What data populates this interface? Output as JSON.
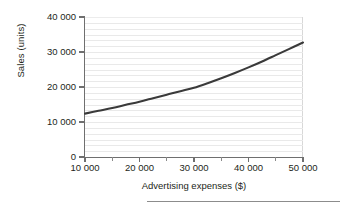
{
  "chart_data": {
    "type": "line",
    "title": "",
    "subtitle": "",
    "xlabel": "Advertising expenses ($)",
    "ylabel": "Sales (units)",
    "xlim": [
      10000,
      50000
    ],
    "ylim": [
      0,
      40000
    ],
    "grid": "horizontal-minor",
    "legend": "none",
    "line_color": "#3a3a3a",
    "grid_color": "#e9e9e9",
    "axis_color": "#6f6f6f",
    "x_ticks": [
      {
        "value": 10000,
        "label": "10 000"
      },
      {
        "value": 20000,
        "label": "20 000"
      },
      {
        "value": 30000,
        "label": "30 000"
      },
      {
        "value": 40000,
        "label": "40 000"
      },
      {
        "value": 50000,
        "label": "50 000"
      }
    ],
    "x_minor_ticks": [
      15000,
      25000,
      35000,
      45000
    ],
    "y_ticks": [
      {
        "value": 0,
        "label": "0"
      },
      {
        "value": 10000,
        "label": "10 000"
      },
      {
        "value": 20000,
        "label": "20 000"
      },
      {
        "value": 30000,
        "label": "30 000"
      },
      {
        "value": 40000,
        "label": "40 000"
      }
    ],
    "series": [
      {
        "name": "Sales",
        "x": [
          10000,
          12500,
          15000,
          17500,
          20000,
          22500,
          25000,
          27500,
          30000,
          32500,
          35000,
          37500,
          40000,
          42500,
          45000,
          47500,
          50000
        ],
        "values": [
          12400,
          13200,
          14000,
          14900,
          15800,
          16800,
          17800,
          18800,
          19800,
          21100,
          22500,
          24000,
          25600,
          27300,
          29100,
          30900,
          32700
        ]
      }
    ]
  },
  "axes": {
    "x_title": "Advertising expenses ($)",
    "y_title": "Sales (units)"
  }
}
